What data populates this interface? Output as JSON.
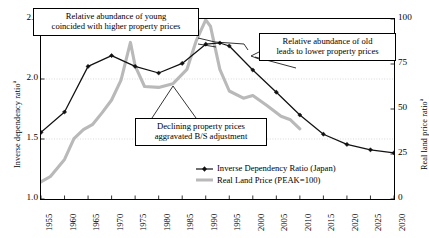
{
  "chart_data": {
    "type": "line",
    "title": "",
    "xlabel": "",
    "ylabel": "Inverse dependency ratio",
    "ylabel_sup": "a",
    "y2label": "Real land price ratio",
    "y2label_sup": "a",
    "xlim": [
      1955,
      2030
    ],
    "ylim": [
      1.0,
      2.5
    ],
    "y2lim": [
      0,
      100
    ],
    "grid": true,
    "grid_values": [
      1.5,
      2.0
    ],
    "legend_position": "inside-bottom-right",
    "xticks": [
      1955,
      1960,
      1965,
      1970,
      1975,
      1980,
      1985,
      1990,
      1995,
      2000,
      2005,
      2010,
      2015,
      2020,
      2025,
      2030
    ],
    "yticks": [
      1.0,
      1.5,
      2.0,
      2.5
    ],
    "y2ticks": [
      0,
      25,
      50,
      75,
      100
    ],
    "series": [
      {
        "name": "Inverse Dependency Ratio (Japan)",
        "axis": "left",
        "color": "#111111",
        "marker": "diamond",
        "x": [
          1955,
          1960,
          1965,
          1970,
          1975,
          1980,
          1985,
          1990,
          1993,
          1995,
          2000,
          2005,
          2010,
          2015,
          2020,
          2025,
          2030
        ],
        "values": [
          1.555,
          1.725,
          2.105,
          2.195,
          2.105,
          2.05,
          2.13,
          2.29,
          2.3,
          2.275,
          2.075,
          1.89,
          1.7,
          1.54,
          1.455,
          1.41,
          1.385
        ]
      },
      {
        "name": "Real Land Price (PEAK=100)",
        "axis": "right",
        "color": "#b9b9b9",
        "marker": "none",
        "x": [
          1955,
          1957,
          1960,
          1962,
          1964,
          1966,
          1968,
          1970,
          1972,
          1974,
          1975,
          1977,
          1980,
          1983,
          1986,
          1988,
          1990,
          1991,
          1993,
          1995,
          1998,
          2000,
          2003,
          2006,
          2008,
          2010
        ],
        "values": [
          9.5,
          12.5,
          22.0,
          33.5,
          38.5,
          41.5,
          48.0,
          55.0,
          66.0,
          87.0,
          74.0,
          62.5,
          62.0,
          64.0,
          72.0,
          88.0,
          99.5,
          96.0,
          72.0,
          60.0,
          56.0,
          57.5,
          52.0,
          46.0,
          44.0,
          39.0
        ]
      }
    ],
    "annotations": [
      {
        "id": "young",
        "text": "Relative abundance of young coincided with higher property prices"
      },
      {
        "id": "old",
        "text": "Relative abundance of old leads to lower property prices"
      },
      {
        "id": "decline",
        "text": "Declining property prices aggravated B/S adjustment"
      }
    ]
  },
  "annotations": {
    "young_line1": "Relative abundance of young",
    "young_line2": "coincided with higher property prices",
    "old_line1": "Relative abundance of old",
    "old_line2": "leads to lower property prices",
    "decline_line1": "Declining property prices",
    "decline_line2": "aggravated B/S adjustment"
  },
  "legend": {
    "item1": "Inverse Dependency Ratio (Japan)",
    "item2": "Real Land Price (PEAK=100)"
  },
  "axes": {
    "left_title": "Inverse dependency ratio",
    "left_title_sup": "a",
    "right_title": "Real land price ratio",
    "right_title_sup": "a",
    "ylabels": [
      "2.5",
      "2.0",
      "1.5",
      "1.0"
    ],
    "y2labels": [
      "100",
      "75",
      "50",
      "25",
      "0"
    ],
    "xlabels": [
      "1955",
      "1960",
      "1965",
      "1970",
      "1975",
      "1980",
      "1985",
      "1990",
      "1995",
      "2000",
      "2005",
      "2010",
      "2015",
      "2020",
      "2025",
      "2030"
    ]
  },
  "colors": {
    "series1": "#111111",
    "series2": "#b9b9b9",
    "axis": "#000000",
    "grid": "#c9c9c9",
    "background": "#ffffff"
  }
}
